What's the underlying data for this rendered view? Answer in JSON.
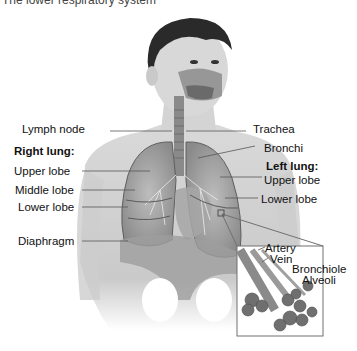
{
  "title": "The lower respiratory system",
  "figure": {
    "labels_left": {
      "lymph_node": "Lymph node",
      "right_lung_heading": "Right lung:",
      "upper_lobe": "Upper lobe",
      "middle_lobe": "Middle lobe",
      "lower_lobe": "Lower lobe",
      "diaphragm": "Diaphragm"
    },
    "labels_right": {
      "trachea": "Trachea",
      "bronchi": "Bronchi",
      "left_lung_heading": "Left lung:",
      "upper_lobe": "Upper lobe",
      "lower_lobe": "Lower lobe"
    },
    "inset_labels": {
      "artery": "Artery",
      "vein": "Vein",
      "bronchiole": "Bronchiole",
      "alveoli": "Alveoli"
    }
  }
}
